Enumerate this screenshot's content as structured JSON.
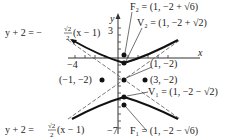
{
  "diagram": {
    "type": "hyperbola-graph",
    "center": {
      "label": "(1, −2)",
      "x": 1,
      "y": -2
    },
    "vertices": [
      {
        "name": "V₂",
        "label": "V₂ = (1, −2 + √2)"
      },
      {
        "name": "V₁",
        "label": "V₁ = (1, −2 − √2)"
      }
    ],
    "foci": [
      {
        "name": "F₂",
        "label": "F₂ = (1, −2 + √6)"
      },
      {
        "name": "F₁",
        "label": "F₁ = (1, −2 − √6)"
      }
    ],
    "points": [
      {
        "label": "(−1, −2)"
      },
      {
        "label": "(3, −2)"
      }
    ],
    "asymptotes": [
      {
        "label": "y + 2 = −√2/2 (x − 1)",
        "lhs": "y + 2 = −",
        "frac_num": "√2",
        "frac_den": "2",
        "rhs": "(x − 1)"
      },
      {
        "label": "y + 2 = √2/2 (x − 1)",
        "lhs": "y + 2 =",
        "frac_num": "√2",
        "frac_den": "2",
        "rhs": "(x − 1)"
      }
    ],
    "axes": {
      "x_label": "x",
      "y_label": "y",
      "x_tick_label": "−4",
      "y_tick_top": "3",
      "y_tick_bottom": "−7"
    },
    "colors": {
      "curve": "#111111",
      "asymptote": "#555555",
      "axis": "#333333"
    }
  }
}
